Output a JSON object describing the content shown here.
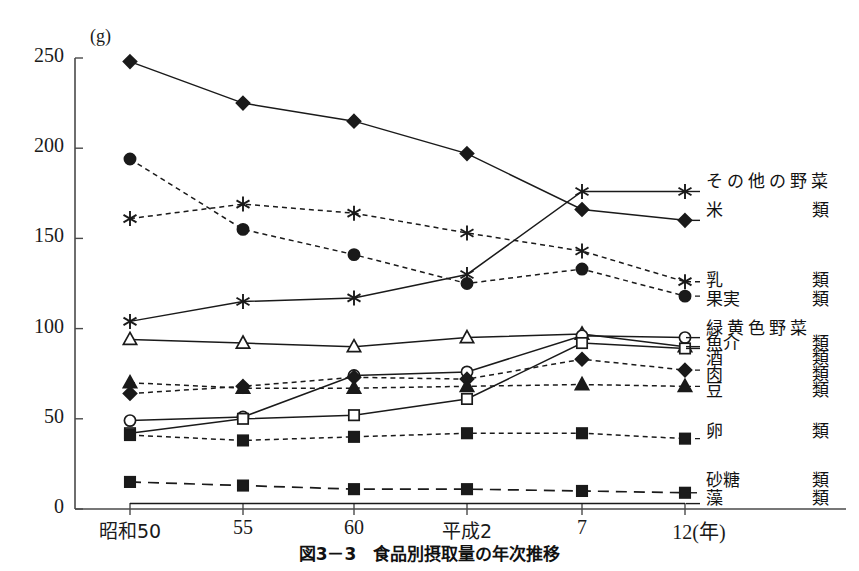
{
  "chart_data": {
    "type": "line",
    "title": "図3－3　食品別摂取量の年次推移",
    "xlabel": "",
    "ylabel": "",
    "unit_label": "(g)",
    "year_axis_suffix": "(年)",
    "categories": [
      "昭和50",
      "55",
      "60",
      "平成2",
      "7",
      "12"
    ],
    "ylim": [
      0,
      250
    ],
    "yticks": [
      0,
      50,
      100,
      150,
      200,
      250
    ],
    "grid": false,
    "legend_position": "right",
    "series": [
      {
        "name": "その他の野菜",
        "suffix": "",
        "marker": "asterisk",
        "fill": "none",
        "line": "solid",
        "values": [
          104,
          115,
          117,
          130,
          176,
          176
        ]
      },
      {
        "name": "米",
        "suffix": "類",
        "marker": "diamond",
        "fill": "solid",
        "line": "solid",
        "values": [
          248,
          225,
          215,
          197,
          166,
          160
        ]
      },
      {
        "name": "乳",
        "suffix": "類",
        "marker": "asterisk",
        "fill": "none",
        "line": "dotted",
        "values": [
          161,
          169,
          164,
          153,
          143,
          126
        ]
      },
      {
        "name": "果実",
        "suffix": "類",
        "marker": "circle",
        "fill": "solid",
        "line": "dotted",
        "values": [
          194,
          155,
          141,
          125,
          133,
          118
        ]
      },
      {
        "name": "緑黄色野菜",
        "suffix": "",
        "marker": "triangle",
        "fill": "none",
        "line": "solid",
        "values": [
          94,
          92,
          90,
          95,
          97,
          90
        ]
      },
      {
        "name": "魚介",
        "suffix": "類",
        "marker": "circle",
        "fill": "none",
        "line": "solid",
        "values": [
          49,
          51,
          74,
          76,
          96,
          95
        ]
      },
      {
        "name": "酒",
        "suffix": "類",
        "marker": "square",
        "fill": "none",
        "line": "solid",
        "values": [
          42,
          50,
          52,
          61,
          92,
          89
        ]
      },
      {
        "name": "肉",
        "suffix": "類",
        "marker": "diamond",
        "fill": "solid",
        "line": "dotted",
        "values": [
          64,
          68,
          73,
          72,
          83,
          77
        ]
      },
      {
        "name": "豆",
        "suffix": "類",
        "marker": "triangle",
        "fill": "solid",
        "line": "dotted",
        "values": [
          70,
          67,
          67,
          68,
          69,
          68
        ]
      },
      {
        "name": "卵",
        "suffix": "類",
        "marker": "square",
        "fill": "solid",
        "line": "dotted",
        "values": [
          41,
          38,
          40,
          42,
          42,
          39
        ]
      },
      {
        "name": "砂糖",
        "suffix": "類",
        "marker": "square",
        "fill": "solid",
        "line": "dashed",
        "values": [
          15,
          13,
          11,
          11,
          10,
          9
        ]
      },
      {
        "name": "藻",
        "suffix": "類",
        "marker": "none",
        "fill": "none",
        "line": "solid",
        "values": [
          3,
          3,
          3,
          3,
          3,
          3
        ]
      }
    ]
  },
  "axis": {
    "y_ticks": [
      "250",
      "200",
      "150",
      "100",
      "50",
      "0"
    ],
    "x_ticks": [
      "昭和50",
      "55",
      "60",
      "平成2",
      "7",
      "12(年)"
    ],
    "unit": "(g)"
  },
  "caption": "図3－3　食品別摂取量の年次推移",
  "colors": {
    "line": "#1a1a1a",
    "axis": "#4a4a4a",
    "text": "#111111",
    "background": "#ffffff"
  }
}
